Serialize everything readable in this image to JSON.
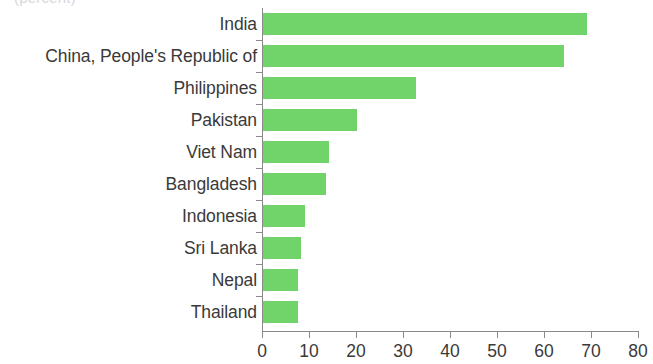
{
  "figure": {
    "unit_note": "(percent)",
    "bar_color": "#70d46a",
    "text_color": "#3a3a3a",
    "axis_color": "#8a8a8a",
    "background": "#ffffff"
  },
  "chart_data": {
    "type": "bar",
    "orientation": "horizontal",
    "title": "",
    "subtitle": "",
    "xlabel": "",
    "ylabel": "",
    "unit_label": "(percent)",
    "xlim": [
      0,
      80
    ],
    "xticks": [
      0,
      10,
      20,
      30,
      40,
      50,
      60,
      70,
      80
    ],
    "xtick_labels": [
      "0",
      "10",
      "20",
      "30",
      "40",
      "50",
      "60",
      "70",
      "80"
    ],
    "grid": false,
    "legend": null,
    "categories": [
      "India",
      "China, People's Republic of",
      "Philippines",
      "Pakistan",
      "Viet Nam",
      "Bangladesh",
      "Indonesia",
      "Sri Lanka",
      "Nepal",
      "Thailand"
    ],
    "values": [
      69,
      64,
      32.5,
      20,
      14,
      13.5,
      9,
      8,
      7.5,
      7.5
    ]
  }
}
